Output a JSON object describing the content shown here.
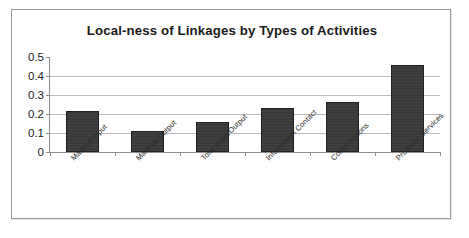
{
  "chart_data": {
    "type": "bar",
    "title": "Local-ness of Linkages by Types of Activities",
    "xlabel": "",
    "ylabel": "",
    "categories": [
      "Material Input",
      "Material Output",
      "Total Input/Output",
      "Information Contact",
      "Collaborations",
      "Producer Services"
    ],
    "values": [
      0.215,
      0.11,
      0.16,
      0.23,
      0.265,
      0.46
    ],
    "ylim": [
      0,
      0.5
    ],
    "ytick_labels": [
      "0.5",
      "0.4",
      "0.3",
      "0.2",
      "0.1",
      "0"
    ],
    "ytick_values": [
      0.5,
      0.4,
      0.3,
      0.2,
      0.1,
      0
    ],
    "grid": true,
    "legend": false,
    "legend_position": "none",
    "bar_color": "#3a3a3a",
    "gridline_color": "#b9b9b9",
    "axis_color": "#8e8e8e",
    "background_color": "#ffffff",
    "label_rotation": -45
  }
}
